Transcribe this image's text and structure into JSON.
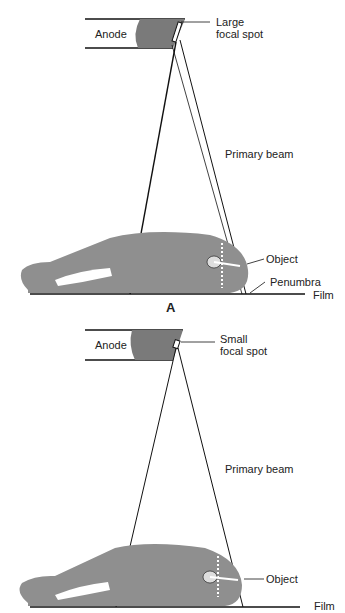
{
  "panels": [
    {
      "id": "A",
      "panel_label": "A",
      "anode_label": "Anode",
      "focal_spot_line1": "Large",
      "focal_spot_line2": "focal spot",
      "beam_label": "Primary beam",
      "object_label": "Object",
      "penumbra_label": "Penumbra",
      "film_label": "Film"
    },
    {
      "id": "B",
      "anode_label": "Anode",
      "focal_spot_line1": "Small",
      "focal_spot_line2": "focal spot",
      "beam_label": "Primary beam",
      "object_label": "Object",
      "film_label": "Film"
    }
  ],
  "colors": {
    "body": "#8f8f8f",
    "anode": "#7a7a7a",
    "line": "#111111"
  }
}
